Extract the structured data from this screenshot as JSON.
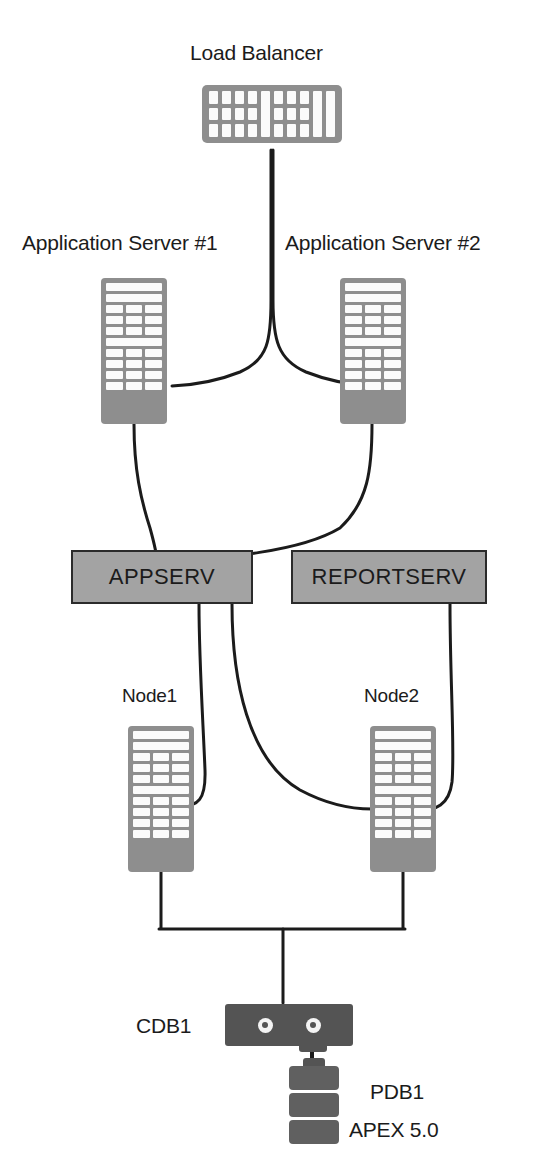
{
  "diagram": {
    "title_text": "",
    "colors": {
      "icon_grey": "#8e8e8e",
      "box_grey": "#a3a3a3",
      "box_border": "#2b2b2b",
      "db_dark": "#545454",
      "line": "#1b1b1b",
      "text": "#1b1b1b",
      "background": "#ffffff"
    },
    "labels": {
      "load_balancer": "Load Balancer",
      "app_server_1": "Application Server #1",
      "app_server_2": "Application Server #2",
      "appserv": "APPSERV",
      "reportserv": "REPORTSERV",
      "node1": "Node1",
      "node2": "Node2",
      "cdb1": "CDB1",
      "pdb1": "PDB1",
      "apex": "APEX 5.0"
    },
    "nodes": [
      {
        "id": "load-balancer",
        "label": "Load Balancer",
        "kind": "load-balancer-icon"
      },
      {
        "id": "app-server-1",
        "label": "Application Server #1",
        "kind": "server-tower-icon"
      },
      {
        "id": "app-server-2",
        "label": "Application Server #2",
        "kind": "server-tower-icon"
      },
      {
        "id": "appserv",
        "label": "APPSERV",
        "kind": "grey-box"
      },
      {
        "id": "reportserv",
        "label": "REPORTSERV",
        "kind": "grey-box"
      },
      {
        "id": "node1",
        "label": "Node1",
        "kind": "server-tower-icon"
      },
      {
        "id": "node2",
        "label": "Node2",
        "kind": "server-tower-icon"
      },
      {
        "id": "cdb1",
        "label": "CDB1",
        "kind": "database-icon"
      },
      {
        "id": "pdb1",
        "label": "PDB1",
        "kind": "pluggable-db-icon"
      },
      {
        "id": "apex",
        "label": "APEX 5.0",
        "kind": "text-annotation"
      }
    ],
    "connections": [
      {
        "from": "load-balancer",
        "to": "app-server-1",
        "style": "curve"
      },
      {
        "from": "load-balancer",
        "to": "app-server-2",
        "style": "curve"
      },
      {
        "from": "app-server-1",
        "to": "appserv",
        "style": "curve"
      },
      {
        "from": "app-server-2",
        "to": "appserv",
        "style": "curve"
      },
      {
        "from": "appserv",
        "to": "node1",
        "style": "curve"
      },
      {
        "from": "appserv",
        "to": "node2",
        "style": "curve"
      },
      {
        "from": "reportserv",
        "to": "node2",
        "style": "curve"
      },
      {
        "from": "node1",
        "to": "cdb1",
        "style": "bracket"
      },
      {
        "from": "node2",
        "to": "cdb1",
        "style": "bracket"
      },
      {
        "from": "cdb1",
        "to": "pdb1",
        "style": "direct"
      }
    ]
  }
}
